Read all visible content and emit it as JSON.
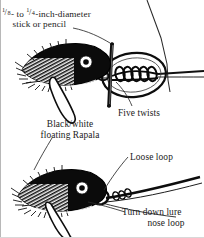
{
  "figure": {
    "ink_color": "#000000",
    "paper_color": "#ffffff",
    "labels": {
      "stick_line1_prefix": "",
      "stick_line1_frac1_num": "1",
      "stick_line1_frac1_den": "8",
      "stick_line1_mid": "- to ",
      "stick_line1_frac2_num": "1",
      "stick_line1_frac2_den": "4",
      "stick_line1_suffix": "-inch-diameter",
      "stick_line2": "stick or pencil",
      "five_twists": "Five twists",
      "rapala_line1": "Black/white",
      "rapala_line2": "floating Rapala",
      "loose_loop": "Loose loop",
      "turn_line1": "Turn down lure",
      "turn_line2": "nose loop"
    },
    "panels": [
      {
        "name": "top-panel",
        "description": "Floating Rapala lure with loop knot held open by a stick, five twists in the standing line"
      },
      {
        "name": "bottom-panel",
        "description": "Floating Rapala lure tilted nose-down with loose loop at nose"
      }
    ]
  }
}
